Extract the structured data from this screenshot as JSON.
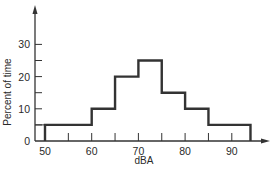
{
  "chart_data": {
    "type": "bar",
    "subtype": "histogram-step",
    "title": "",
    "xlabel": "dBA",
    "ylabel": "Percent of time",
    "xlim": [
      48,
      97
    ],
    "ylim": [
      0,
      37
    ],
    "x_ticks": [
      50,
      60,
      70,
      80,
      90
    ],
    "x_minor_ticks": [
      55,
      65,
      75,
      85
    ],
    "y_ticks": [
      0,
      10,
      20,
      30
    ],
    "y_minor_ticks": [
      5,
      15,
      25
    ],
    "grid": false,
    "legend": null,
    "bins": [
      {
        "from": 50,
        "to": 60,
        "value": 5
      },
      {
        "from": 60,
        "to": 65,
        "value": 10
      },
      {
        "from": 65,
        "to": 70,
        "value": 20
      },
      {
        "from": 70,
        "to": 75,
        "value": 25
      },
      {
        "from": 75,
        "to": 80,
        "value": 15
      },
      {
        "from": 80,
        "to": 85,
        "value": 10
      },
      {
        "from": 85,
        "to": 94,
        "value": 5
      }
    ],
    "categories": [
      "50-60",
      "60-65",
      "65-70",
      "70-75",
      "75-80",
      "80-85",
      "85-94"
    ],
    "values": [
      5,
      10,
      20,
      25,
      15,
      10,
      5
    ],
    "color": "#333333"
  },
  "labels": {
    "x_axis": "dBA",
    "y_axis": "Percent of time",
    "x_tick_labels": [
      "50",
      "60",
      "70",
      "80",
      "90"
    ],
    "y_tick_labels": [
      "0",
      "10",
      "20",
      "30"
    ]
  }
}
